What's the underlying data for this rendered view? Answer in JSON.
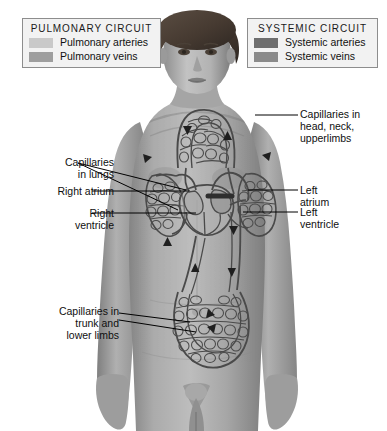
{
  "figure": {
    "kind": "anatomy-diagram",
    "background_color": "#ffffff",
    "body_tone": "#9a9a9a"
  },
  "legends": [
    {
      "id": "pulmonary",
      "title": "PULMONARY  CIRCUIT",
      "rows": [
        {
          "label": "Pulmonary arteries",
          "color": "#c9c9c9"
        },
        {
          "label": "Pulmonary veins",
          "color": "#9e9e9e"
        }
      ]
    },
    {
      "id": "systemic",
      "title": "SYSTEMIC  CIRCUIT",
      "rows": [
        {
          "label": "Systemic arteries",
          "color": "#6e6e6e"
        },
        {
          "label": "Systemic veins",
          "color": "#8a8a8a"
        }
      ]
    }
  ],
  "callouts": {
    "capillaries_head": "Capillaries in\nhead, neck,\nupperlimbs",
    "left_atrium": "Left\natrium",
    "left_ventricle": "Left\nventricle",
    "capillaries_lungs": "Capillaries\nin lungs",
    "right_atrium": "Right atrium",
    "right_ventricle": "Right\nventricle",
    "capillaries_trunk": "Capillaries in\ntrunk and\nlower limbs"
  },
  "colors": {
    "vessel_line": "#4a4a4a",
    "vessel_dark": "#3b3b3b",
    "leader_line": "#000000",
    "legend_fill": "#f2f2f2",
    "legend_border": "#8d8d8d",
    "skin_light": "#b9b9b9",
    "skin_mid": "#9b9b9b",
    "skin_dark": "#7d7d7d",
    "hair": "#4b4036"
  },
  "flow_arrows": {
    "count": 10,
    "description": "Directional arrowheads along vessels indicating blood flow"
  }
}
